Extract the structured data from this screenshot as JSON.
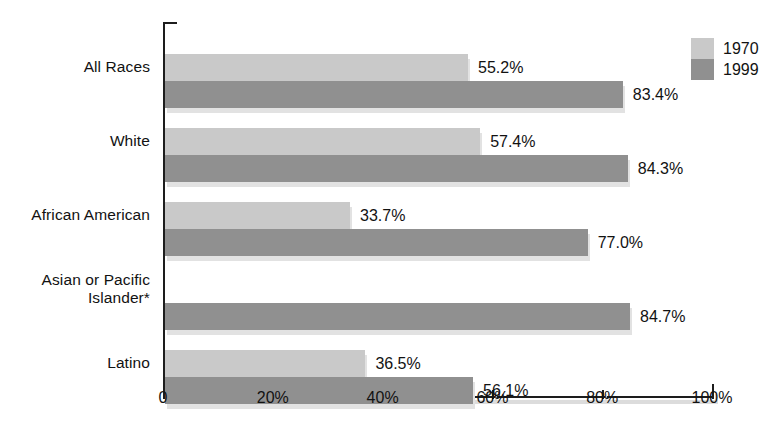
{
  "chart_data": {
    "type": "bar",
    "orientation": "horizontal",
    "title": "",
    "subtitle": "",
    "xlabel": "",
    "ylabel": "",
    "xlim": [
      0,
      100
    ],
    "grid": false,
    "legend_position": "top-right",
    "categories": [
      "All Races",
      "White",
      "African American",
      "Asian or Pacific\nIslander*",
      "Latino"
    ],
    "xticks": [
      0,
      20,
      40,
      60,
      80,
      100
    ],
    "xtick_labels": [
      "0",
      "20%",
      "40%",
      "60%",
      "80%",
      "100%"
    ],
    "series": [
      {
        "name": "1970",
        "color": "#c9c9c9",
        "values": [
          55.2,
          57.4,
          33.7,
          null,
          36.5
        ],
        "labels": [
          "55.2%",
          "57.4%",
          "33.7%",
          "",
          "36.5%"
        ]
      },
      {
        "name": "1999",
        "color": "#909090",
        "values": [
          83.4,
          84.3,
          77.0,
          84.7,
          56.1
        ],
        "labels": [
          "83.4%",
          "84.3%",
          "77.0%",
          "84.7%",
          "56.1%"
        ]
      }
    ]
  },
  "legend": {
    "entries": [
      {
        "label": "1970",
        "color": "#c9c9c9"
      },
      {
        "label": "1999",
        "color": "#909090"
      }
    ]
  },
  "colors": {
    "series_1970": "#c9c9c9",
    "series_1999": "#909090",
    "axis": "#1d1d1d",
    "shadow": "#e2e2e2",
    "background": "#ffffff"
  }
}
